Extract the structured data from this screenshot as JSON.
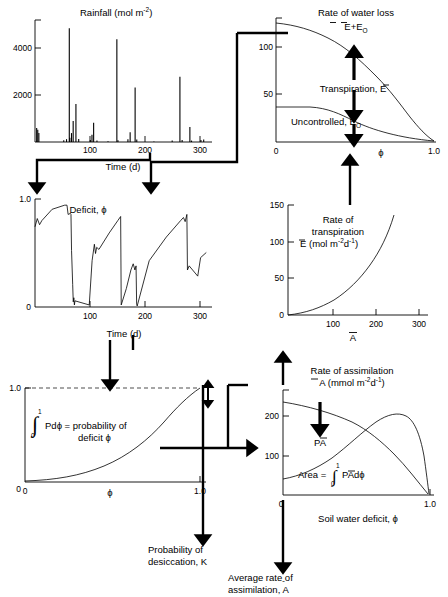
{
  "panels": {
    "rainfall": {
      "title_main": "Rainfall (mol m",
      "title_sup": "-2",
      "title_end": ")",
      "xlabel": "Time (d)",
      "xticks": [
        "100",
        "200",
        "300"
      ],
      "yticks": [
        "2000",
        "4000"
      ]
    },
    "water_loss": {
      "title_line1": "Rate of water loss",
      "title_line2_a": "E",
      "title_line2_b": "+E",
      "title_line2_sub": "O",
      "label_transpiration": "Transpiration, E",
      "label_uncontrolled_a": "Uncontrolled, E",
      "label_uncontrolled_sub": "O",
      "xlabel": "ϕ",
      "xticks": [
        "0",
        "1.0"
      ],
      "yticks": [
        "50",
        "100"
      ]
    },
    "deficit": {
      "title_a": "Deficit, ",
      "title_b": "ϕ",
      "xlabel": "Time (d)",
      "xticks": [
        "100",
        "200",
        "300"
      ],
      "yticks": [
        "0",
        "1.0"
      ]
    },
    "transpiration": {
      "title_line1": "Rate of",
      "title_line2": "transpiration",
      "title_line3_a": "E",
      "title_line3_b": " (mol m",
      "title_line3_sup1": "-2",
      "title_line3_c": "d",
      "title_line3_sup2": "-1",
      "title_line3_d": ")",
      "xlabel": "A",
      "xticks": [
        "100",
        "200",
        "300"
      ],
      "yticks": [
        "0",
        "50",
        "100",
        "150"
      ]
    },
    "probability": {
      "label_integral_a": "Pd",
      "label_integral_b": "ϕ",
      "label_integral_c": " = probability of",
      "label_integral_d": "deficit   ",
      "label_integral_e": "ϕ",
      "integral_upper": "1",
      "integral_lower": "0",
      "xlabel": "ϕ",
      "xticks": [
        "0",
        "1.0"
      ],
      "yticks": [
        "0",
        "1.0"
      ]
    },
    "assimilation": {
      "title_line1": "Rate of assimilation",
      "title_line2_a": "A",
      "title_line2_b": " (mmol m",
      "title_line2_sup1": "-2",
      "title_line2_c": "d",
      "title_line2_sup2": "-1",
      "title_line2_d": ")",
      "label_pa_a": "P",
      "label_pa_b": "A",
      "label_area_a": "Area = ",
      "label_area_b": "P",
      "label_area_c": "Ad",
      "label_area_d": "ϕ",
      "area_upper": "1",
      "area_lower": "0",
      "xlabel": "Soil water deficit, ϕ",
      "xticks": [
        "0",
        "1.0"
      ],
      "yticks": [
        "0",
        "100",
        "200"
      ]
    }
  },
  "outputs": {
    "desiccation_line1": "Probability of",
    "desiccation_line2": "desiccation, K",
    "avg_assim_line1": "Average rate of",
    "avg_assim_line2_a": "assimilation, ",
    "avg_assim_line2_b": "A"
  },
  "chart_data": {
    "type": "line",
    "charts": [
      {
        "id": "rainfall",
        "type": "bar",
        "title": "Rainfall (mol m-2)",
        "xlabel": "Time (d)",
        "ylabel": "Rainfall (mol m-2)",
        "xlim": [
          0,
          320
        ],
        "ylim": [
          0,
          5200
        ],
        "xticks": [
          100,
          200,
          300
        ],
        "yticks": [
          2000,
          4000
        ],
        "x": [
          3,
          5,
          7,
          52,
          57,
          62,
          63,
          66,
          69,
          74,
          79,
          100,
          103,
          106,
          112,
          132,
          148,
          150,
          168,
          172,
          181,
          184,
          215,
          248,
          262,
          266,
          280,
          283,
          300,
          305
        ],
        "values": [
          600,
          520,
          380,
          70,
          120,
          4850,
          180,
          380,
          900,
          1620,
          130,
          80,
          310,
          820,
          60,
          30,
          4380,
          70,
          120,
          420,
          2320,
          110,
          20,
          60,
          2780,
          80,
          640,
          60,
          80,
          110
        ]
      },
      {
        "id": "water_loss",
        "type": "line",
        "title": "Rate of water loss",
        "xlabel": "ϕ",
        "ylabel": "Rate of water loss",
        "xlim": [
          0,
          1.0
        ],
        "ylim": [
          0,
          130
        ],
        "xticks": [
          0,
          1.0
        ],
        "yticks": [
          50,
          100
        ],
        "series": [
          {
            "name": "E+E0",
            "x": [
              0,
              0.1,
              0.2,
              0.3,
              0.4,
              0.5,
              0.6,
              0.7,
              0.8,
              0.9,
              0.95,
              1.0
            ],
            "values": [
              122,
              119,
              114,
              108,
              100,
              90,
              79,
              66,
              52,
              33,
              20,
              3
            ]
          },
          {
            "name": "E0 (uncontrolled)",
            "x": [
              0,
              0.2,
              0.3,
              0.4,
              0.5,
              0.6,
              0.7,
              0.8,
              0.9,
              1.0
            ],
            "values": [
              28,
              28,
              26,
              22,
              18,
              14,
              11,
              8,
              5,
              3
            ]
          }
        ],
        "annotations": [
          "Transpiration, E",
          "Uncontrolled, EO"
        ]
      },
      {
        "id": "deficit",
        "type": "line",
        "title": "Deficit, ϕ",
        "xlabel": "Time (d)",
        "ylabel": "Deficit ϕ",
        "xlim": [
          0,
          310
        ],
        "ylim": [
          0,
          1.05
        ],
        "xticks": [
          100,
          200,
          300
        ],
        "yticks": [
          0,
          1.0
        ],
        "x": [
          0,
          4,
          8,
          12,
          30,
          52,
          56,
          58,
          62,
          63,
          64,
          66,
          67,
          68,
          69,
          70,
          95,
          100,
          104,
          106,
          108,
          112,
          130,
          145,
          150,
          151,
          160,
          168,
          172,
          175,
          177,
          178,
          179,
          200,
          230,
          255,
          260,
          263,
          266,
          267,
          270,
          285,
          290,
          300
        ],
        "values": [
          0.78,
          0.86,
          0.8,
          0.84,
          0.95,
          0.99,
          0.99,
          0.9,
          0.91,
          0.9,
          0.55,
          0.22,
          0.05,
          0.09,
          0.02,
          0.06,
          0.02,
          0.45,
          0.61,
          0.52,
          0.58,
          0.56,
          0.72,
          0.84,
          0.88,
          0.02,
          0.18,
          0.36,
          0.42,
          0.36,
          0.4,
          0.03,
          0.01,
          0.45,
          0.68,
          0.84,
          0.87,
          0.83,
          0.9,
          0.36,
          0.4,
          0.3,
          0.48,
          0.53
        ]
      },
      {
        "id": "transpiration",
        "type": "line",
        "title": "Rate of transpiration E (mol m-2 d-1)",
        "xlabel": "A",
        "ylabel": "E (mol m-2 d-1)",
        "xlim": [
          0,
          320
        ],
        "ylim": [
          0,
          155
        ],
        "xticks": [
          100,
          200,
          300
        ],
        "yticks": [
          0,
          50,
          100,
          150
        ],
        "x": [
          0,
          40,
          80,
          120,
          160,
          190,
          215,
          235,
          250,
          260
        ],
        "values": [
          0,
          7,
          18,
          33,
          52,
          70,
          90,
          110,
          127,
          140
        ]
      },
      {
        "id": "probability",
        "type": "line",
        "title": "Probability of deficit ϕ",
        "xlabel": "ϕ",
        "ylabel": "P",
        "xlim": [
          0,
          1.05
        ],
        "ylim": [
          0,
          1.05
        ],
        "xticks": [
          0,
          1.0
        ],
        "yticks": [
          0,
          1.0
        ],
        "x": [
          0,
          0.1,
          0.2,
          0.3,
          0.4,
          0.5,
          0.6,
          0.7,
          0.8,
          0.9,
          0.95,
          1.0
        ],
        "values": [
          0.005,
          0.02,
          0.05,
          0.09,
          0.15,
          0.23,
          0.35,
          0.5,
          0.68,
          0.87,
          0.95,
          1.0
        ]
      },
      {
        "id": "assimilation",
        "type": "line",
        "title": "Rate of assimilation A (mmol m-2 d-1)",
        "xlabel": "Soil water deficit, ϕ",
        "ylabel": "A (mmol m-2 d-1)",
        "xlim": [
          0,
          1.0
        ],
        "ylim": [
          0,
          250
        ],
        "xticks": [
          0,
          1.0
        ],
        "yticks": [
          0,
          100,
          200
        ],
        "series": [
          {
            "name": "A",
            "x": [
              0,
              0.2,
              0.4,
              0.5,
              0.6,
              0.7,
              0.8,
              0.9,
              0.95,
              1.0
            ],
            "values": [
              232,
              216,
              196,
              185,
              172,
              156,
              133,
              92,
              58,
              5
            ]
          },
          {
            "name": "PA",
            "x": [
              0,
              0.1,
              0.2,
              0.3,
              0.4,
              0.5,
              0.6,
              0.65,
              0.7,
              0.75,
              0.8,
              0.85,
              0.9,
              0.95,
              1.0
            ],
            "values": [
              42,
              48,
              58,
              74,
              96,
              126,
              168,
              190,
              203,
              206,
              200,
              180,
              140,
              80,
              5
            ]
          }
        ],
        "annotations": [
          "PA",
          "Area = integral PAdϕ"
        ]
      }
    ]
  }
}
